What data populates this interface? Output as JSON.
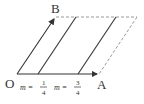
{
  "diagram": {
    "labels": {
      "origin": "O",
      "point_a": "A",
      "point_b": "B",
      "m1_prefix": "m =",
      "m1_num": "1",
      "m1_den": "4",
      "m2_prefix": "m =",
      "m2_num": "3",
      "m2_den": "4"
    },
    "colors": {
      "stroke": "#333333",
      "dashed": "#888888"
    }
  }
}
